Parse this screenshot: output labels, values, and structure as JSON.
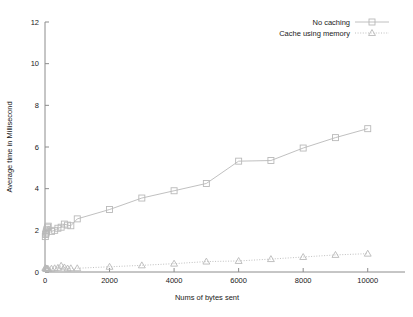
{
  "chart_data": {
    "type": "line",
    "title": "",
    "xlabel": "Nums of bytes sent",
    "ylabel": "Average time in Millisecond",
    "xlim": [
      0,
      11000
    ],
    "ylim": [
      0,
      12
    ],
    "xticks": [
      0,
      2000,
      4000,
      6000,
      8000,
      10000
    ],
    "yticks": [
      0,
      2,
      4,
      6,
      8,
      10,
      12
    ],
    "xticklabels": [
      "0",
      "2000",
      "4000",
      "6000",
      "8000",
      "10000"
    ],
    "yticklabels": [
      "0",
      "2",
      "4",
      "6",
      "8",
      "10",
      "12"
    ],
    "grid": false,
    "legend_position": "top-right",
    "series": [
      {
        "name": "No caching",
        "marker": "open-square",
        "linestyle": "solid",
        "color": "#b9b9b9",
        "points": [
          {
            "x": 10,
            "y": 1.7
          },
          {
            "x": 20,
            "y": 1.8
          },
          {
            "x": 30,
            "y": 1.86
          },
          {
            "x": 40,
            "y": 1.92
          },
          {
            "x": 50,
            "y": 1.98
          },
          {
            "x": 60,
            "y": 2.05
          },
          {
            "x": 80,
            "y": 2.15
          },
          {
            "x": 100,
            "y": 2.2
          },
          {
            "x": 200,
            "y": 1.95
          },
          {
            "x": 300,
            "y": 2.0
          },
          {
            "x": 400,
            "y": 2.1
          },
          {
            "x": 500,
            "y": 2.15
          },
          {
            "x": 600,
            "y": 2.3
          },
          {
            "x": 700,
            "y": 2.25
          },
          {
            "x": 800,
            "y": 2.22
          },
          {
            "x": 1000,
            "y": 2.55
          },
          {
            "x": 2000,
            "y": 3.0
          },
          {
            "x": 3000,
            "y": 3.55
          },
          {
            "x": 4000,
            "y": 3.9
          },
          {
            "x": 5000,
            "y": 4.25
          },
          {
            "x": 6000,
            "y": 5.32
          },
          {
            "x": 7000,
            "y": 5.35
          },
          {
            "x": 8000,
            "y": 5.95
          },
          {
            "x": 9000,
            "y": 6.45
          },
          {
            "x": 10000,
            "y": 6.88
          }
        ]
      },
      {
        "name": "Cache using memory",
        "marker": "open-triangle",
        "linestyle": "dotted",
        "color": "#b9b9b9",
        "points": [
          {
            "x": 10,
            "y": 0.2
          },
          {
            "x": 20,
            "y": 0.18
          },
          {
            "x": 30,
            "y": 0.17
          },
          {
            "x": 40,
            "y": 0.16
          },
          {
            "x": 50,
            "y": 0.16
          },
          {
            "x": 60,
            "y": 0.15
          },
          {
            "x": 80,
            "y": 0.15
          },
          {
            "x": 100,
            "y": 0.14
          },
          {
            "x": 200,
            "y": 0.16
          },
          {
            "x": 300,
            "y": 0.18
          },
          {
            "x": 400,
            "y": 0.2
          },
          {
            "x": 500,
            "y": 0.3
          },
          {
            "x": 600,
            "y": 0.22
          },
          {
            "x": 700,
            "y": 0.17
          },
          {
            "x": 800,
            "y": 0.18
          },
          {
            "x": 1000,
            "y": 0.18
          },
          {
            "x": 2000,
            "y": 0.25
          },
          {
            "x": 3000,
            "y": 0.32
          },
          {
            "x": 4000,
            "y": 0.4
          },
          {
            "x": 5000,
            "y": 0.5
          },
          {
            "x": 6000,
            "y": 0.53
          },
          {
            "x": 7000,
            "y": 0.62
          },
          {
            "x": 8000,
            "y": 0.72
          },
          {
            "x": 9000,
            "y": 0.82
          },
          {
            "x": 10000,
            "y": 0.88
          }
        ]
      }
    ]
  },
  "legend": {
    "entries": [
      {
        "label": "No caching"
      },
      {
        "label": "Cache using memory"
      }
    ]
  },
  "axes": {
    "x_title": "Nums of bytes sent",
    "y_title": "Average time in Millisecond"
  },
  "colors": {
    "series_line": "#b9b9b9",
    "axis": "#8c8c8c",
    "text": "#1a1a1a",
    "background": "#ffffff"
  }
}
